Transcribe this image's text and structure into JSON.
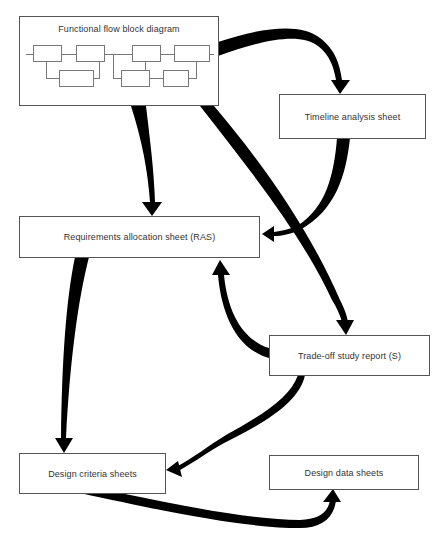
{
  "diagram": {
    "colors": {
      "arrow": "#000000",
      "box_border": "#555555",
      "text": "#333333",
      "background": "#ffffff"
    },
    "nodes": {
      "ffbd": {
        "label": "Functional flow block diagram"
      },
      "timeline": {
        "label": "Timeline analysis sheet"
      },
      "ras": {
        "label": "Requirements allocation sheet (RAS)"
      },
      "tradeoff": {
        "label": "Trade-off study report (S)"
      },
      "criteria": {
        "label": "Design criteria sheets"
      },
      "data": {
        "label": "Design data sheets"
      }
    },
    "edges": [
      {
        "from": "Functional flow block diagram",
        "to": "Timeline analysis sheet"
      },
      {
        "from": "Functional flow block diagram",
        "to": "Requirements allocation sheet (RAS)"
      },
      {
        "from": "Functional flow block diagram",
        "to": "Trade-off study report (S)"
      },
      {
        "from": "Timeline analysis sheet",
        "to": "Requirements allocation sheet (RAS)"
      },
      {
        "from": "Trade-off study report (S)",
        "to": "Requirements allocation sheet (RAS)"
      },
      {
        "from": "Requirements allocation sheet (RAS)",
        "to": "Design criteria sheets"
      },
      {
        "from": "Trade-off study report (S)",
        "to": "Design criteria sheets"
      },
      {
        "from": "Design criteria sheets",
        "to": "Design data sheets"
      }
    ]
  }
}
